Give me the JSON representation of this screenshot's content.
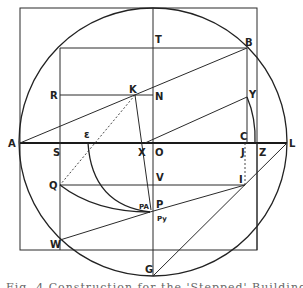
{
  "figure": {
    "type": "geometric-construction",
    "labels": {
      "T": "T",
      "B": "B",
      "R": "R",
      "K": "K",
      "N": "N",
      "Y": "Y",
      "A": "A",
      "S": "S",
      "e": "ɛ",
      "X": "X",
      "O": "O",
      "J": "J",
      "C": "C",
      "Z": "Z",
      "L": "L",
      "Q": "Q",
      "V": "V",
      "I": "I",
      "PA": "PA",
      "P": "P",
      "Py": "Py",
      "W": "W",
      "G": "G"
    },
    "colors": {
      "line": "#2a2a2a",
      "background": "#ffffff"
    }
  },
  "caption": "Fig. 4  Construction for the 'Stepped' Building Line"
}
